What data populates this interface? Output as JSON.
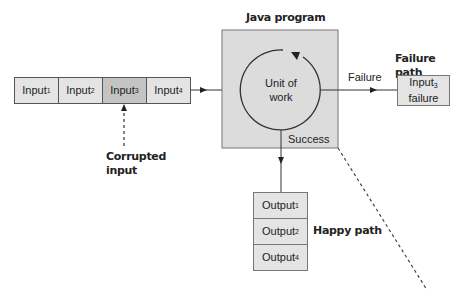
{
  "title": "Java program",
  "inputs": [
    {
      "base": "Input",
      "sub": "1"
    },
    {
      "base": "Input",
      "sub": "2"
    },
    {
      "base": "Input",
      "sub": "3",
      "highlighted": true
    },
    {
      "base": "Input",
      "sub": "4"
    }
  ],
  "corrupted_label": {
    "line1": "Corrupted",
    "line2": "input"
  },
  "unit_of_work": {
    "line1": "Unit of",
    "line2": "work"
  },
  "failure_edge_label": "Failure",
  "success_edge_label": "Success",
  "failure_path": {
    "heading": "Failure path",
    "box": {
      "base": "Input",
      "sub": "3",
      "line2": "failure"
    }
  },
  "outputs": [
    {
      "base": "Output",
      "sub": "1"
    },
    {
      "base": "Output",
      "sub": "2"
    },
    {
      "base": "Output",
      "sub": "4"
    }
  ],
  "happy_path_label": "Happy path",
  "colors": {
    "box_fill": "#e4e4e4",
    "highlight_fill": "#c4c4c4",
    "program_fill": "#dcdcdc",
    "stroke": "#333333"
  }
}
